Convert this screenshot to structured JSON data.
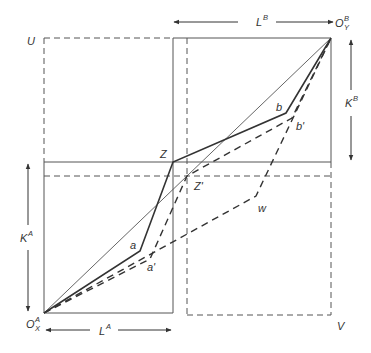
{
  "diagram": {
    "title": "",
    "labels": {
      "U": "U",
      "V": "V",
      "Z": "Z",
      "Z_prime": "Z'",
      "a": "a",
      "a_prime": "a'",
      "b": "b",
      "b_prime": "b'",
      "w": "w",
      "origin_A_main": "O",
      "origin_A_sup": "A",
      "origin_A_sub": "X",
      "origin_B_main": "O",
      "origin_B_sup": "B",
      "origin_B_sub": "Y",
      "LA_main": "L",
      "LA_sup": "A",
      "LB_main": "L",
      "LB_sup": "B",
      "KA_main": "K",
      "KA_sup": "A",
      "KB_main": "K",
      "KB_sup": "B"
    },
    "colors": {
      "line": "#333333",
      "thin_line": "#555555",
      "background": "#ffffff"
    },
    "points": {
      "O_A": [
        44,
        313
      ],
      "O_B": [
        331,
        38
      ],
      "Z": [
        173,
        162
      ],
      "Z_prime": [
        187,
        176
      ],
      "a": [
        140,
        251
      ],
      "a_prime": [
        150,
        259
      ],
      "b": [
        286,
        113
      ],
      "b_prime": [
        292,
        118
      ],
      "w": [
        256,
        196
      ],
      "U": [
        44,
        38
      ],
      "V": [
        331,
        315
      ]
    }
  }
}
